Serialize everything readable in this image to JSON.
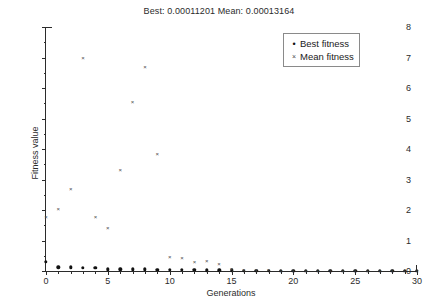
{
  "chart_data": {
    "type": "scatter",
    "title": "Best: 0.00011201 Mean: 0.00013164",
    "xlabel": "Generations",
    "ylabel": "Fitness value",
    "xlim": [
      0,
      30
    ],
    "ylim": [
      0,
      8
    ],
    "xticks": [
      0,
      5,
      10,
      15,
      20,
      25,
      30
    ],
    "yticks": [
      0,
      1,
      2,
      3,
      4,
      5,
      6,
      7,
      8
    ],
    "grid": false,
    "legend_position": "top-right",
    "x": [
      0,
      1,
      2,
      3,
      4,
      5,
      6,
      7,
      8,
      9,
      10,
      11,
      12,
      13,
      14,
      15,
      16,
      17,
      18,
      19,
      20,
      21,
      22,
      23,
      24,
      25,
      26,
      27,
      28,
      29,
      30
    ],
    "series": [
      {
        "name": "Best fitness",
        "marker": "dot",
        "color": "#111111",
        "values": [
          0.3,
          0.12,
          0.12,
          0.11,
          0.1,
          0.06,
          0.06,
          0.05,
          0.05,
          0.04,
          0.04,
          0.03,
          0.03,
          0.02,
          0.02,
          0.02,
          0.01,
          0.01,
          0.01,
          0.01,
          0.01,
          0.005,
          0.005,
          0.005,
          0.005,
          0.003,
          0.003,
          0.002,
          0.002,
          0.001,
          0.00011201
        ]
      },
      {
        "name": "Mean fitness",
        "marker": "cross",
        "color": "#4a4a4a",
        "values": [
          1.78,
          2.03,
          2.7,
          7.0,
          1.78,
          1.4,
          3.3,
          5.55,
          6.7,
          3.85,
          0.45,
          0.42,
          0.3,
          0.32,
          0.22,
          0.05,
          0.03,
          0.02,
          0.02,
          0.01,
          0.01,
          0.01,
          0.01,
          0.01,
          0.005,
          0.005,
          0.005,
          0.003,
          0.003,
          0.002,
          0.00013164
        ]
      }
    ],
    "legend": [
      "Best fitness",
      "Mean fitness"
    ]
  },
  "legend": {
    "best_label": "Best fitness",
    "mean_label": "Mean fitness",
    "best_marker": "•",
    "mean_marker": "×"
  }
}
